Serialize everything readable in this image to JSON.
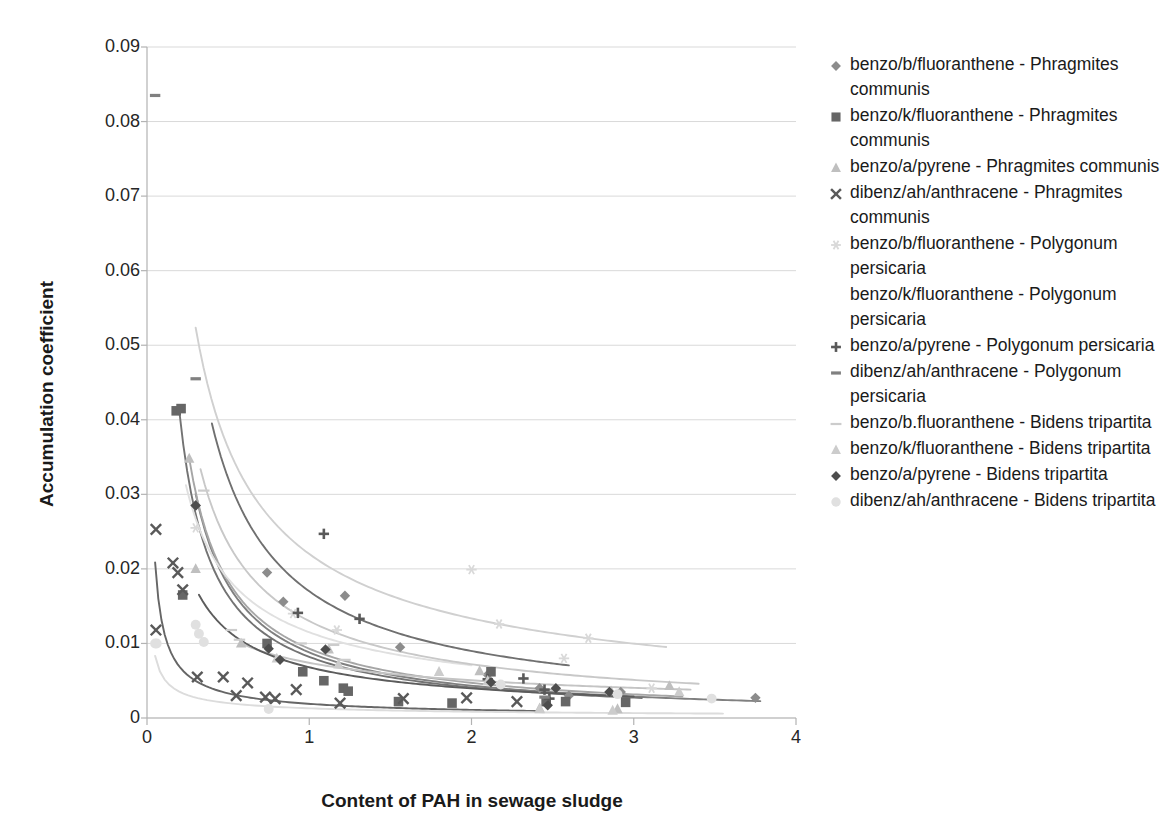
{
  "chart_data": {
    "type": "scatter",
    "title": "",
    "xlabel": "Content of PAH in sewage sludge",
    "ylabel": "Accumulation coefficient",
    "xlim": [
      0,
      4
    ],
    "ylim": [
      0,
      0.09
    ],
    "xticks": [
      "0",
      "1",
      "2",
      "3",
      "4"
    ],
    "yticks": [
      "0",
      "0.01",
      "0.02",
      "0.03",
      "0.04",
      "0.05",
      "0.06",
      "0.07",
      "0.08",
      "0.09"
    ],
    "ytick_values": [
      0,
      0.01,
      0.02,
      0.03,
      0.04,
      0.05,
      0.06,
      0.07,
      0.08,
      0.09
    ],
    "xtick_values": [
      0,
      1,
      2,
      3,
      4
    ],
    "grid": "horizontal",
    "legend_position": "right",
    "series": [
      {
        "name": "benzo/b/fluoranthene - Phragmites communis",
        "marker": "diamond",
        "color": "#8c8c8c",
        "points": [
          [
            0.3,
            0.0285
          ],
          [
            0.74,
            0.0195
          ],
          [
            0.84,
            0.0156
          ],
          [
            1.22,
            0.0164
          ],
          [
            1.56,
            0.0095
          ],
          [
            2.1,
            0.0058
          ],
          [
            2.42,
            0.004
          ],
          [
            2.6,
            0.003
          ],
          [
            2.92,
            0.0035
          ],
          [
            3.75,
            0.0027
          ]
        ],
        "trend": {
          "a": 0.0088,
          "b": 1.02,
          "x0": 0.3,
          "x1": 3.78,
          "color": "#808080"
        }
      },
      {
        "name": "benzo/k/fluoranthene - Phragmites communis",
        "marker": "square",
        "color": "#666666",
        "points": [
          [
            0.18,
            0.0412
          ],
          [
            0.21,
            0.0415
          ],
          [
            0.22,
            0.0165
          ],
          [
            0.74,
            0.01
          ],
          [
            0.96,
            0.0062
          ],
          [
            1.09,
            0.005
          ],
          [
            1.21,
            0.004
          ],
          [
            1.24,
            0.0036
          ],
          [
            1.55,
            0.0022
          ],
          [
            1.88,
            0.002
          ],
          [
            2.12,
            0.0062
          ],
          [
            2.46,
            0.0022
          ],
          [
            2.58,
            0.0022
          ],
          [
            2.95,
            0.0021
          ]
        ],
        "trend": {
          "a": 0.0082,
          "b": 1.0,
          "x0": 0.2,
          "x1": 3.05,
          "color": "#737373"
        }
      },
      {
        "name": "benzo/a/pyrene - Phragmites communis",
        "marker": "triangle",
        "color": "#bfbfbf",
        "points": [
          [
            0.26,
            0.0348
          ],
          [
            0.3,
            0.02
          ],
          [
            0.58,
            0.01
          ],
          [
            1.12,
            0.0092
          ],
          [
            2.05,
            0.0063
          ],
          [
            2.42,
            0.0013
          ],
          [
            2.86,
            0.0036
          ],
          [
            2.9,
            0.0012
          ],
          [
            3.22,
            0.0043
          ]
        ],
        "trend": {
          "a": 0.0093,
          "b": 0.98,
          "x0": 0.26,
          "x1": 3.3,
          "color": "#a6a6a6"
        }
      },
      {
        "name": "dibenz/ah/anthracene - Phragmites communis",
        "marker": "cross",
        "color": "#595959",
        "points": [
          [
            0.055,
            0.0253
          ],
          [
            0.055,
            0.0118
          ],
          [
            0.16,
            0.0208
          ],
          [
            0.19,
            0.0195
          ],
          [
            0.22,
            0.0172
          ],
          [
            0.31,
            0.0055
          ],
          [
            0.47,
            0.0055
          ],
          [
            0.55,
            0.003
          ],
          [
            0.62,
            0.0047
          ],
          [
            0.73,
            0.0028
          ],
          [
            0.79,
            0.0026
          ],
          [
            0.92,
            0.0038
          ],
          [
            1.19,
            0.002
          ],
          [
            1.58,
            0.0026
          ],
          [
            1.97,
            0.0027
          ],
          [
            2.28,
            0.0022
          ]
        ],
        "trend": {
          "a": 0.0019,
          "b": 0.8,
          "x0": 0.05,
          "x1": 2.4,
          "color": "#666666"
        }
      },
      {
        "name": "benzo/b/fluoranthene - Polygonum persicaria",
        "marker": "asterisk",
        "color": "#d9d9d9",
        "points": [
          [
            0.3,
            0.0255
          ],
          [
            0.9,
            0.014
          ],
          [
            1.17,
            0.0118
          ],
          [
            2.0,
            0.0199
          ],
          [
            2.17,
            0.0126
          ],
          [
            2.57,
            0.008
          ],
          [
            2.72,
            0.0107
          ],
          [
            3.11,
            0.004
          ]
        ],
        "trend": {
          "a": 0.022,
          "b": 0.72,
          "x0": 0.3,
          "x1": 3.2,
          "color": "#d0d0d0"
        }
      },
      {
        "name": "benzo/k/fluoranthene - Polygonum persicaria",
        "marker": "none",
        "color": "#e6e6e6",
        "points": [
          [
            0.24,
            0.03
          ],
          [
            0.52,
            0.0125
          ],
          [
            0.54,
            0.0112
          ],
          [
            0.6,
            0.0102
          ],
          [
            0.95,
            0.006
          ],
          [
            1.7,
            0.0042
          ]
        ],
        "trend": {
          "a": 0.0115,
          "b": 0.7,
          "x0": 0.24,
          "x1": 2.0,
          "color": "#e0e0e0"
        }
      },
      {
        "name": "benzo/a/pyrene - Polygonum persicaria",
        "marker": "plus",
        "color": "#595959",
        "points": [
          [
            1.09,
            0.0247
          ],
          [
            0.93,
            0.0141
          ],
          [
            1.31,
            0.0133
          ],
          [
            2.1,
            0.0052
          ],
          [
            2.32,
            0.0053
          ],
          [
            2.45,
            0.0038
          ],
          [
            2.48,
            0.0026
          ]
        ],
        "trend": {
          "a": 0.017,
          "b": 0.92,
          "x0": 0.4,
          "x1": 2.6,
          "color": "#707070"
        }
      },
      {
        "name": "dibenz/ah/anthracene - Polygonum persicaria",
        "marker": "dash",
        "color": "#808080",
        "points": [
          [
            0.05,
            0.0835
          ],
          [
            0.3,
            0.0455
          ],
          [
            2.45,
            0.0028
          ]
        ],
        "trend": null
      },
      {
        "name": "benzo/b.fluoranthene - Bidens tripartita",
        "marker": "line",
        "color": "#cccccc",
        "points": [
          [
            0.35,
            0.0305
          ],
          [
            0.52,
            0.0118
          ],
          [
            0.57,
            0.0105
          ],
          [
            0.95,
            0.01
          ],
          [
            1.15,
            0.0098
          ],
          [
            1.22,
            0.0078
          ]
        ],
        "trend": {
          "a": 0.013,
          "b": 0.85,
          "x0": 0.33,
          "x1": 3.4,
          "color": "#c8c8c8"
        }
      },
      {
        "name": "benzo/k/fluoranthene - Bidens tripartita",
        "marker": "triangle",
        "color": "#cccccc",
        "points": [
          [
            0.8,
            0.008
          ],
          [
            1.18,
            0.0072
          ],
          [
            1.8,
            0.0062
          ],
          [
            2.1,
            0.005
          ],
          [
            2.42,
            0.0012
          ],
          [
            2.87,
            0.001
          ],
          [
            3.28,
            0.0035
          ]
        ],
        "trend": {
          "a": 0.0074,
          "b": 0.55,
          "x0": 0.6,
          "x1": 3.35,
          "color": "#c4c4c4"
        }
      },
      {
        "name": "benzo/a/pyrene - Bidens tripartita",
        "marker": "diamond",
        "color": "#4d4d4d",
        "points": [
          [
            0.3,
            0.0285
          ],
          [
            0.75,
            0.0093
          ],
          [
            0.82,
            0.0078
          ],
          [
            1.1,
            0.0092
          ],
          [
            2.12,
            0.0048
          ],
          [
            2.47,
            0.0017
          ],
          [
            2.52,
            0.004
          ],
          [
            2.85,
            0.0035
          ]
        ],
        "trend": {
          "a": 0.0068,
          "b": 0.78,
          "x0": 0.32,
          "x1": 3.0,
          "color": "#5c5c5c"
        }
      },
      {
        "name": "dibenz/ah/anthracene - Bidens tripartita",
        "marker": "circle",
        "color": "#e0e0e0",
        "points": [
          [
            0.05,
            0.01
          ],
          [
            0.06,
            0.01
          ],
          [
            0.3,
            0.0125
          ],
          [
            0.32,
            0.0113
          ],
          [
            0.35,
            0.0102
          ],
          [
            0.75,
            0.0012
          ],
          [
            2.18,
            0.0045
          ],
          [
            2.9,
            0.0032
          ],
          [
            3.48,
            0.0026
          ]
        ],
        "trend": {
          "a": 0.0013,
          "b": 0.62,
          "x0": 0.05,
          "x1": 3.55,
          "color": "#dcdcdc"
        }
      }
    ],
    "legend_entries": [
      {
        "label": "benzo/b/fluoranthene - Phragmites communis",
        "marker": "diamond",
        "color": "#8c8c8c"
      },
      {
        "label": "benzo/k/fluoranthene - Phragmites communis",
        "marker": "square",
        "color": "#666666"
      },
      {
        "label": "benzo/a/pyrene - Phragmites communis",
        "marker": "triangle",
        "color": "#bfbfbf"
      },
      {
        "label": "dibenz/ah/anthracene - Phragmites communis",
        "marker": "cross",
        "color": "#595959"
      },
      {
        "label": "benzo/b/fluoranthene - Polygonum persicaria",
        "marker": "asterisk",
        "color": "#d9d9d9"
      },
      {
        "label": "benzo/k/fluoranthene - Polygonum persicaria",
        "marker": "none",
        "color": "#e6e6e6"
      },
      {
        "label": "benzo/a/pyrene - Polygonum persicaria",
        "marker": "plus",
        "color": "#595959"
      },
      {
        "label": "dibenz/ah/anthracene - Polygonum persicaria",
        "marker": "dash",
        "color": "#808080"
      },
      {
        "label": "benzo/b.fluoranthene - Bidens tripartita",
        "marker": "line",
        "color": "#cccccc"
      },
      {
        "label": "benzo/k/fluoranthene - Bidens tripartita",
        "marker": "triangle",
        "color": "#cccccc"
      },
      {
        "label": "benzo/a/pyrene - Bidens tripartita",
        "marker": "diamond",
        "color": "#4d4d4d"
      },
      {
        "label": "dibenz/ah/anthracene - Bidens tripartita",
        "marker": "circle",
        "color": "#e0e0e0"
      }
    ]
  },
  "axis": {
    "grid_color": "#d9d9d9",
    "axis_color": "#b3b3b3",
    "tick_text_color": "#262626"
  }
}
